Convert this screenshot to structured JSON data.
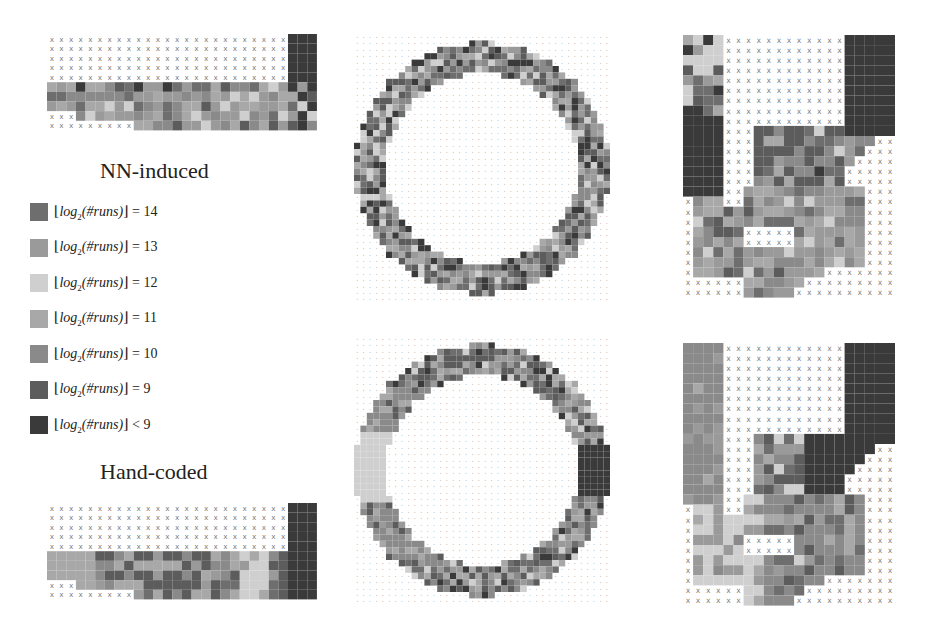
{
  "titles": {
    "nn_induced": "NN-induced",
    "hand_coded": "Hand-coded"
  },
  "legend": {
    "items": [
      {
        "level": "14",
        "relation": "=",
        "value": "14",
        "color": "#6e6e6e"
      },
      {
        "level": "13",
        "relation": "=",
        "value": "13",
        "color": "#9a9a9a"
      },
      {
        "level": "12",
        "relation": "=",
        "value": "12",
        "color": "#cfcfcf"
      },
      {
        "level": "11",
        "relation": "=",
        "value": "11",
        "color": "#a8a8a8"
      },
      {
        "level": "10",
        "relation": "=",
        "value": "10",
        "color": "#8a8a8a"
      },
      {
        "level": "9",
        "relation": "=",
        "value": "9",
        "color": "#5c5c5c"
      },
      {
        "level": "lt9",
        "relation": "<",
        "value": "9",
        "color": "#3a3a3a"
      }
    ],
    "label_prefix": "log",
    "label_sub": "2",
    "label_arg": "(#runs)"
  },
  "panels": [
    {
      "id": "strip-nn",
      "track": "straight-strip",
      "policy": "NN-induced"
    },
    {
      "id": "ring-nn",
      "track": "ring",
      "policy": "NN-induced"
    },
    {
      "id": "hook-nn",
      "track": "hook",
      "policy": "NN-induced"
    },
    {
      "id": "strip-hand",
      "track": "straight-strip",
      "policy": "Hand-coded"
    },
    {
      "id": "ring-hand",
      "track": "ring",
      "policy": "Hand-coded"
    },
    {
      "id": "hook-hand",
      "track": "hook",
      "policy": "Hand-coded"
    }
  ]
}
